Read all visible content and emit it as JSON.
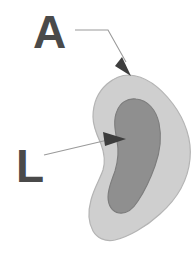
{
  "figure": {
    "background_color": "#ffffff",
    "width": 196,
    "height": 257
  },
  "labels": [
    {
      "id": "A",
      "text": "A",
      "meaning": "anterior-region-label",
      "color": "#4a4a4a",
      "x": 33,
      "y": 48,
      "font_size": 46
    },
    {
      "id": "L",
      "text": "L",
      "meaning": "lateral-region-label",
      "color": "#4a4a4a",
      "x": 16,
      "y": 182,
      "font_size": 46
    }
  ],
  "leaders": [
    {
      "id": "leader-a",
      "for_label": "A",
      "color": "#9a9a9a",
      "path": "M 75 30 L 108 30 L 126 62",
      "arrow_points": "122,57 131,76 115,66",
      "arrow_color": "#3d3d3d"
    },
    {
      "id": "leader-l",
      "for_label": "L",
      "color": "#9a9a9a",
      "path": "M 44 155 L 112 139",
      "arrow_points": "103,132 126,139 105,146",
      "arrow_color": "#3d3d3d"
    }
  ],
  "regions": [
    {
      "id": "outer-region",
      "name": "outer-tissue-region",
      "fill": "#cfcfcf",
      "stroke": "#b4b4b4",
      "pointed_to_by": "A",
      "path": "M 129 75 C 146 76 161 88 173 104 C 185 120 192 140 190 159 C 188 180 177 199 160 214 C 146 227 128 237 115 240 C 105 242 97 238 93 231 C 88 222 88 211 91 200 C 94 188 100 179 103 170 C 106 160 104 152 101 144 C 97 135 93 127 93 117 C 93 104 98 92 107 84 C 114 78 121 75 129 75 Z"
    },
    {
      "id": "inner-region",
      "name": "inner-tissue-structure",
      "fill": "#8f8f8f",
      "stroke": "#7d7d7d",
      "pointed_to_by": "L",
      "path": "M 136 99 C 148 100 156 110 159 123 C 162 137 160 152 155 166 C 150 180 144 192 138 201 C 133 209 126 214 119 213 C 112 212 108 205 108 197 C 108 188 112 180 115 171 C 118 161 119 151 117 141 C 115 130 113 120 117 111 C 120 103 127 98 136 99 Z"
    }
  ]
}
